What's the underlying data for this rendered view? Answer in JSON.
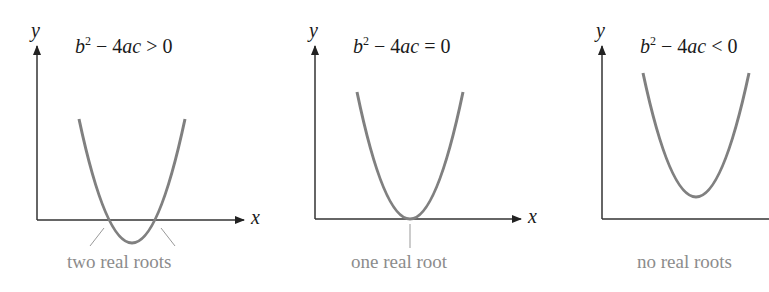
{
  "panels": [
    {
      "formula": {
        "lhs_base": "b",
        "lhs_exp": "2",
        "minus": "−",
        "term": "4",
        "term_vars": "ac",
        "relation": ">",
        "rhs": "0"
      },
      "x_axis_label": "x",
      "y_axis_label": "y",
      "caption": "two real roots"
    },
    {
      "formula": {
        "lhs_base": "b",
        "lhs_exp": "2",
        "minus": "−",
        "term": "4",
        "term_vars": "ac",
        "relation": "=",
        "rhs": "0"
      },
      "x_axis_label": "x",
      "y_axis_label": "y",
      "caption": "one real root"
    },
    {
      "formula": {
        "lhs_base": "b",
        "lhs_exp": "2",
        "minus": "−",
        "term": "4",
        "term_vars": "ac",
        "relation": "<",
        "rhs": "0"
      },
      "x_axis_label": "x",
      "y_axis_label": "y",
      "caption": "no real roots"
    }
  ],
  "colors": {
    "axis": "#333333",
    "curve": "#808080",
    "caption": "#8c8c8c"
  }
}
